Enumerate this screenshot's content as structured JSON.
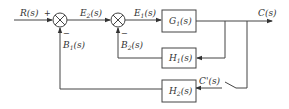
{
  "diagram": {
    "type": "block-diagram",
    "title": "",
    "signals": {
      "input": {
        "base": "R",
        "sub": "",
        "arg": "(s)"
      },
      "error2": {
        "base": "E",
        "sub": "2",
        "arg": "(s)"
      },
      "error1": {
        "base": "E",
        "sub": "1",
        "arg": "(s)"
      },
      "output": {
        "base": "C",
        "sub": "",
        "arg": "(s)"
      },
      "feedback1": {
        "base": "B",
        "sub": "1",
        "arg": "(s)"
      },
      "feedback2": {
        "base": "B",
        "sub": "2",
        "arg": "(s)"
      },
      "sampled_output": {
        "base": "C'",
        "sub": "",
        "arg": "(s)"
      }
    },
    "blocks": [
      {
        "id": "G1",
        "base": "G",
        "sub": "1",
        "arg": "(s)"
      },
      {
        "id": "H1",
        "base": "H",
        "sub": "1",
        "arg": "(s)"
      },
      {
        "id": "H2",
        "base": "H",
        "sub": "2",
        "arg": "(s)"
      }
    ],
    "summing_junctions": [
      {
        "id": "sum1",
        "signs": {
          "top_left": "+",
          "bottom": "−"
        }
      },
      {
        "id": "sum2",
        "signs": {
          "bottom": "−"
        }
      }
    ],
    "switch": {
      "label": "open switch on outer feedback path"
    },
    "colors": {
      "line": "#444444",
      "text": "#333333",
      "background": "#ffffff"
    }
  }
}
